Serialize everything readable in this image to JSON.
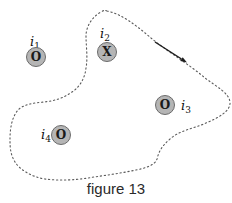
{
  "caption": "figure 13",
  "colors": {
    "background": "#ffffff",
    "loop_stroke": "#5a5a5a",
    "arrow": "#1c1c1c",
    "symbol_fill": "#b5b5b5",
    "symbol_border": "#6b6b6b",
    "symbol_glyph": "#1a1a1a",
    "label_text": "#111111"
  },
  "loop": {
    "style": "dotted closed curve",
    "direction": "clockwise",
    "path": "M107,11 C122,14 137,26 151,38 C168,52 190,65 205,78 C217,87 229,93 230,102 C231,111 218,118 206,123 C193,129 180,130 170,139 C162,146 159,151 157,159 C155,165 146,168 136,170 C122,173 108,175 94,177 C78,180 60,181 45,179 C32,177 20,170 15,162 C10,154 10,146 10,139 C10,128 12,117 18,110 C24,104 34,103 44,102 C54,101 64,98 72,92 C81,86 85,77 86,68 C88,57 86,46 86,36 C86,26 93,16 101,12 C104,10 105,10 107,11 Z",
    "arrow_line_d": "M155,42 L181.5,59",
    "arrow_head_points": "187,62.5 180.3,60.9 182.7,57.2"
  },
  "currents": [
    {
      "label_base": "i",
      "label_sub": "1",
      "symbol": "O",
      "direction": "out-of-page",
      "inside_loop": false
    },
    {
      "label_base": "i",
      "label_sub": "2",
      "symbol": "X",
      "direction": "into-page",
      "inside_loop": true
    },
    {
      "label_base": "i",
      "label_sub": "3",
      "symbol": "O",
      "direction": "out-of-page",
      "inside_loop": true
    },
    {
      "label_base": "i",
      "label_sub": "4",
      "symbol": "O",
      "direction": "out-of-page",
      "inside_loop": true
    }
  ]
}
